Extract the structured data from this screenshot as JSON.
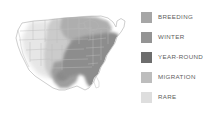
{
  "figure": {
    "name": "bird-range-map",
    "background": "#ffffff"
  },
  "map": {
    "region": "United States",
    "outline_color": "#b9b9b9",
    "state_border_color": "#c9c9c9",
    "regions": [
      {
        "name": "year-round-southeast",
        "category": "YEAR-ROUND",
        "color": "#8f8f8f"
      },
      {
        "name": "breeding-north-central",
        "category": "BREEDING",
        "color": "#a8a8a8"
      },
      {
        "name": "winter-south-texas",
        "category": "WINTER",
        "color": "#9b9b9b"
      },
      {
        "name": "migration-great-plains",
        "category": "MIGRATION",
        "color": "#c4c4c4"
      },
      {
        "name": "rare-west",
        "category": "RARE",
        "color": "#e2e2e2"
      }
    ]
  },
  "legend": {
    "items": [
      {
        "label": "BREEDING",
        "color": "#a6a6a6"
      },
      {
        "label": "WINTER",
        "color": "#949494"
      },
      {
        "label": "YEAR-ROUND",
        "color": "#6d6d6d"
      },
      {
        "label": "MIGRATION",
        "color": "#bdbdbd"
      },
      {
        "label": "RARE",
        "color": "#dedede"
      }
    ],
    "text_color": "#5d5d5d"
  }
}
